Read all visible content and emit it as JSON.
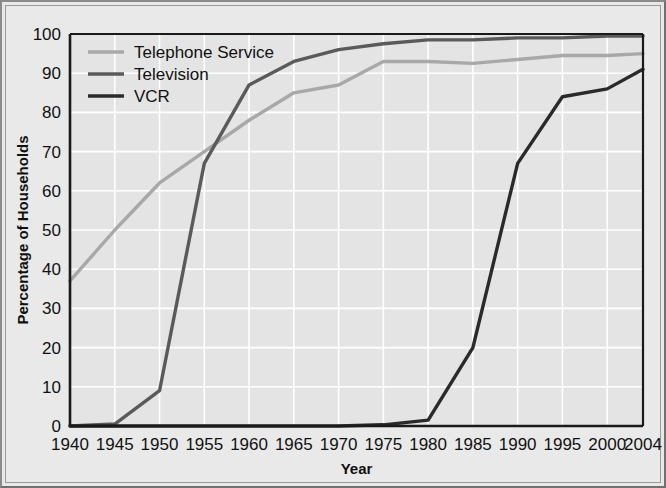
{
  "chart_data": {
    "type": "line",
    "title": "",
    "xlabel": "Year",
    "ylabel": "Percentage of Households",
    "xlim": [
      1940,
      2004
    ],
    "ylim": [
      0,
      100
    ],
    "grid": true,
    "legend_position": "top-left-inside",
    "x": [
      1940,
      1945,
      1950,
      1955,
      1960,
      1965,
      1970,
      1975,
      1980,
      1985,
      1990,
      1995,
      2000,
      2004
    ],
    "xtick_labels": [
      "1940",
      "1945",
      "1950",
      "1955",
      "1960",
      "1965",
      "1970",
      "1975",
      "1980",
      "1985",
      "1990",
      "1995",
      "2000",
      "2004"
    ],
    "ytick_labels": [
      "0",
      "10",
      "20",
      "30",
      "40",
      "50",
      "60",
      "70",
      "80",
      "90",
      "100"
    ],
    "ytick_values": [
      0,
      10,
      20,
      30,
      40,
      50,
      60,
      70,
      80,
      90,
      100
    ],
    "series": [
      {
        "name": "Telephone Service",
        "color": "#a8a8a8",
        "values": [
          37,
          50,
          62,
          70,
          78,
          85,
          87,
          93,
          93,
          92.5,
          93.5,
          94.5,
          94.5,
          95
        ]
      },
      {
        "name": "Television",
        "color": "#5a5a5a",
        "values": [
          0,
          0.5,
          9,
          67,
          87,
          93,
          96,
          97.5,
          98.5,
          98.5,
          99,
          99,
          99.5,
          99.5
        ]
      },
      {
        "name": "VCR",
        "color": "#2a2a2a",
        "values": [
          0,
          0,
          0,
          0,
          0,
          0,
          0,
          0.3,
          1.5,
          20,
          67,
          84,
          86,
          91
        ]
      }
    ]
  },
  "legend": {
    "items": [
      {
        "label": "Telephone Service"
      },
      {
        "label": "Television"
      },
      {
        "label": "VCR"
      }
    ]
  },
  "colors": {
    "plot_background": "#e4e4e4",
    "gridline": "#ffffff",
    "axis": "#1a1a1a",
    "figure_background": "#e8e8e8",
    "telephone": "#a8a8a8",
    "television": "#5a5a5a",
    "vcr": "#2a2a2a"
  }
}
